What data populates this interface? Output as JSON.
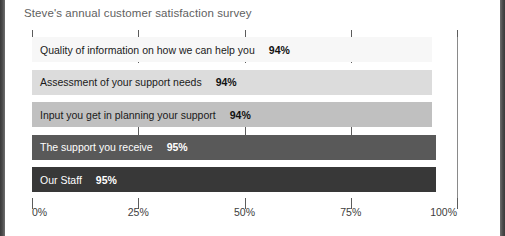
{
  "chart_data": {
    "type": "bar",
    "orientation": "horizontal",
    "title": "Steve's annual customer satisfaction survey",
    "xlabel": "",
    "ylabel": "",
    "xlim": [
      0,
      100
    ],
    "grid": true,
    "legend": false,
    "tick_labels": [
      "0%",
      "25%",
      "50%",
      "75%",
      "100%"
    ],
    "tick_values": [
      0,
      25,
      50,
      75,
      100
    ],
    "categories": [
      "Quality of information on how we can help you",
      "Assessment of your support needs",
      "Input you get in planning your support",
      "The support you receive",
      "Our Staff"
    ],
    "values": [
      94,
      94,
      94,
      95,
      95
    ],
    "value_labels": [
      "94%",
      "94%",
      "94%",
      "95%",
      "95%"
    ],
    "bar_colors": [
      "#f7f7f7",
      "#dcdcdc",
      "#c0c0c0",
      "#595959",
      "#383838"
    ],
    "bars": [
      {
        "label": "Quality of information on how we can help you",
        "value": 94,
        "value_label": "94%",
        "color": "#f7f7f7",
        "text_on_dark": false
      },
      {
        "label": "Assessment of your support needs",
        "value": 94,
        "value_label": "94%",
        "color": "#dcdcdc",
        "text_on_dark": false
      },
      {
        "label": "Input you get in planning your support",
        "value": 94,
        "value_label": "94%",
        "color": "#c0c0c0",
        "text_on_dark": false
      },
      {
        "label": "The support you receive",
        "value": 95,
        "value_label": "95%",
        "color": "#595959",
        "text_on_dark": true
      },
      {
        "label": "Our Staff",
        "value": 95,
        "value_label": "95%",
        "color": "#383838",
        "text_on_dark": true
      }
    ]
  }
}
